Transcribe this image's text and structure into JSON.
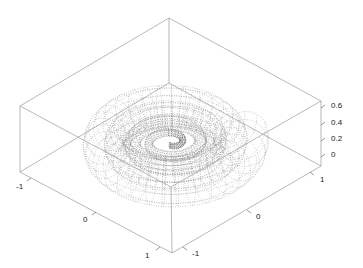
{
  "chart_data": {
    "type": "surface3d",
    "title": "",
    "style": "dotted mesh lines, grey on white, box frame",
    "axes": {
      "x": {
        "label": "",
        "range": [
          -1.2,
          1.2
        ],
        "ticks": [
          -1,
          0,
          1
        ],
        "tick_labels": [
          "-1",
          "0",
          "1"
        ],
        "position": "front-left edge"
      },
      "y": {
        "label": "",
        "range": [
          -1.2,
          1.2
        ],
        "ticks": [
          -1,
          0,
          1
        ],
        "tick_labels": [
          "-1",
          "0",
          "1"
        ],
        "position": "front-right edge"
      },
      "z": {
        "label": "",
        "range": [
          -0.1,
          0.65
        ],
        "ticks": [
          0,
          0.2,
          0.4,
          0.6
        ],
        "tick_labels": [
          "0",
          "0.2",
          "0.4",
          "0.6"
        ],
        "position": "right vertical edge"
      }
    },
    "grid": false,
    "legend": null
  },
  "axis_labels": {
    "x_ticks": [
      "-1",
      "0",
      "1"
    ],
    "y_ticks": [
      "-1",
      "0",
      "1"
    ],
    "z_ticks": [
      "0.6",
      "0.4",
      "0.2",
      "0"
    ]
  },
  "colors": {
    "background": "#ffffff",
    "box": "#9a9a9a",
    "mesh": "#7a7a7a",
    "text": "#222222"
  }
}
